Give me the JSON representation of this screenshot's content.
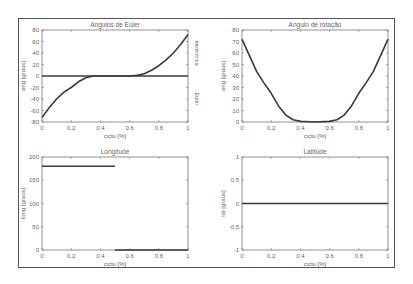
{
  "chart_data": [
    {
      "type": "line",
      "title": "Angulos de Euler",
      "xlabel": "ciclo [%]",
      "ylabel": "ang [graus]",
      "right_labels": [
        "excêntrica",
        "Euler"
      ],
      "xlim": [
        0,
        1
      ],
      "ylim": [
        -80,
        80
      ],
      "xticks": [
        "0",
        "0.2",
        "0.4",
        "0.6",
        "0.8",
        "1"
      ],
      "yticks": [
        "80",
        "60",
        "40",
        "20",
        "0",
        "-20",
        "-40",
        "-60",
        "-80"
      ],
      "series": [
        {
          "name": "curve",
          "x": [
            0,
            0.05,
            0.1,
            0.15,
            0.2,
            0.25,
            0.3,
            0.35,
            0.4,
            0.5,
            0.6,
            0.65,
            0.7,
            0.75,
            0.8,
            0.85,
            0.9,
            0.95,
            1.0
          ],
          "values": [
            -72,
            -55,
            -40,
            -28,
            -20,
            -10,
            -3,
            0,
            0,
            0,
            0,
            1,
            4,
            10,
            18,
            28,
            40,
            55,
            72
          ]
        },
        {
          "name": "zero",
          "x": [
            0,
            1
          ],
          "values": [
            0,
            0
          ]
        }
      ]
    },
    {
      "type": "line",
      "title": "Angulo de rotação",
      "xlabel": "ciclo [%]",
      "ylabel": "ang [graus]",
      "xlim": [
        0,
        1
      ],
      "ylim": [
        0,
        80
      ],
      "xticks": [
        "0",
        "0.2",
        "0.4",
        "0.6",
        "0.8",
        "1"
      ],
      "yticks": [
        "80",
        "70",
        "60",
        "50",
        "40",
        "30",
        "20",
        "10",
        "0"
      ],
      "series": [
        {
          "name": "rotation",
          "x": [
            0,
            0.05,
            0.1,
            0.15,
            0.2,
            0.25,
            0.3,
            0.35,
            0.4,
            0.5,
            0.6,
            0.65,
            0.7,
            0.75,
            0.8,
            0.85,
            0.9,
            0.95,
            1.0
          ],
          "values": [
            72,
            58,
            44,
            34,
            25,
            14,
            6,
            2,
            0.5,
            0,
            0.5,
            2,
            6,
            14,
            25,
            34,
            44,
            58,
            72
          ]
        }
      ]
    },
    {
      "type": "line",
      "title": "Longitude",
      "xlabel": "ciclo [%]",
      "ylabel": "long [graus]",
      "xlim": [
        0,
        1
      ],
      "ylim": [
        0,
        200
      ],
      "xticks": [
        "0",
        "0.2",
        "0.4",
        "0.6",
        "0.8",
        "1"
      ],
      "yticks": [
        "200",
        "150",
        "100",
        "50",
        "0"
      ],
      "series": [
        {
          "name": "seg1",
          "x": [
            0,
            0.5
          ],
          "values": [
            180,
            180
          ]
        },
        {
          "name": "seg2",
          "x": [
            0.5,
            1
          ],
          "values": [
            0,
            0
          ]
        }
      ]
    },
    {
      "type": "line",
      "title": "Latitude",
      "xlabel": "ciclo [%]",
      "ylabel": "lat [graus]",
      "xlim": [
        0,
        1
      ],
      "ylim": [
        -1,
        1
      ],
      "xticks": [
        "0",
        "0.2",
        "0.4",
        "0.6",
        "0.8",
        "1"
      ],
      "yticks": [
        "1",
        "0.5",
        "0",
        "-0.5",
        "-1"
      ],
      "series": [
        {
          "name": "latitude",
          "x": [
            0,
            1
          ],
          "values": [
            0,
            0
          ]
        }
      ]
    }
  ]
}
